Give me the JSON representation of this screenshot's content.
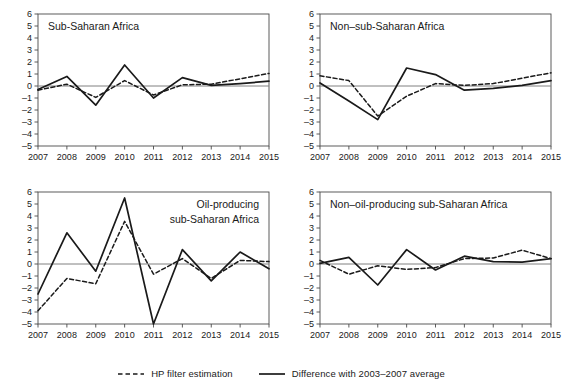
{
  "figure": {
    "name": "four-panel-line-chart",
    "y_axis": {
      "min": -5,
      "max": 6,
      "ticks": [
        "6",
        "5",
        "4",
        "3",
        "2",
        "1",
        "0",
        "–1",
        "–2",
        "–3",
        "–4",
        "–5"
      ]
    },
    "x_axis": {
      "ticks": [
        "2007",
        "2008",
        "2009",
        "2010",
        "2011",
        "2012",
        "2013",
        "2014",
        "2015"
      ]
    }
  },
  "legend": {
    "entries": [
      {
        "label": "HP filter estimation",
        "style": "dashed",
        "color": "#1a1a1a",
        "icon": "dashed-line-icon"
      },
      {
        "label": "Difference with 2003–2007 average",
        "style": "solid",
        "color": "#1a1a1a",
        "icon": "solid-line-icon"
      }
    ]
  },
  "chart_data": [
    {
      "type": "line",
      "panel": "top-left",
      "title": "Sub-Saharan Africa",
      "title_lines": [
        "Sub-Saharan Africa"
      ],
      "title_anchor": "left",
      "x": [
        2007,
        2008,
        2009,
        2010,
        2011,
        2012,
        2013,
        2014,
        2015
      ],
      "categories": [
        "2007",
        "2008",
        "2009",
        "2010",
        "2011",
        "2012",
        "2013",
        "2014",
        "2015"
      ],
      "xlabel": "",
      "ylabel": "",
      "ylim": [
        -5,
        6
      ],
      "xlim": [
        2007,
        2015
      ],
      "grid": false,
      "zero_line": true,
      "legend_position": "figure-bottom",
      "series": [
        {
          "name": "HP filter estimation",
          "style": "dashed",
          "values": [
            -0.35,
            0.15,
            -0.95,
            0.45,
            -0.75,
            0.1,
            0.15,
            0.6,
            1.05
          ]
        },
        {
          "name": "Difference with 2003–2007 average",
          "style": "solid",
          "values": [
            -0.3,
            0.8,
            -1.6,
            1.75,
            -1.0,
            0.7,
            0.05,
            0.2,
            0.4
          ]
        }
      ]
    },
    {
      "type": "line",
      "panel": "top-right",
      "title": "Non–sub-Saharan Africa",
      "title_lines": [
        "Non–sub-Saharan Africa"
      ],
      "title_anchor": "left",
      "x": [
        2007,
        2008,
        2009,
        2010,
        2011,
        2012,
        2013,
        2014,
        2015
      ],
      "categories": [
        "2007",
        "2008",
        "2009",
        "2010",
        "2011",
        "2012",
        "2013",
        "2014",
        "2015"
      ],
      "xlabel": "",
      "ylabel": "",
      "ylim": [
        -5,
        6
      ],
      "xlim": [
        2007,
        2015
      ],
      "grid": false,
      "zero_line": true,
      "legend_position": "figure-bottom",
      "series": [
        {
          "name": "HP filter estimation",
          "style": "dashed",
          "values": [
            0.85,
            0.45,
            -2.5,
            -0.85,
            0.2,
            0.05,
            0.2,
            0.65,
            1.1
          ]
        },
        {
          "name": "Difference with 2003–2007 average",
          "style": "solid",
          "values": [
            0.25,
            -1.25,
            -2.8,
            1.5,
            0.95,
            -0.35,
            -0.2,
            0.05,
            0.45
          ]
        }
      ]
    },
    {
      "type": "line",
      "panel": "bottom-left",
      "title": "Oil-producing sub-Saharan Africa",
      "title_lines": [
        "Oil-producing",
        "sub-Saharan Africa"
      ],
      "title_anchor": "right",
      "x": [
        2007,
        2008,
        2009,
        2010,
        2011,
        2012,
        2013,
        2014,
        2015
      ],
      "categories": [
        "2007",
        "2008",
        "2009",
        "2010",
        "2011",
        "2012",
        "2013",
        "2014",
        "2015"
      ],
      "xlabel": "",
      "ylabel": "",
      "ylim": [
        -5,
        6
      ],
      "xlim": [
        2007,
        2015
      ],
      "grid": false,
      "zero_line": true,
      "legend_position": "figure-bottom",
      "series": [
        {
          "name": "HP filter estimation",
          "style": "dashed",
          "values": [
            -3.9,
            -1.2,
            -1.65,
            3.55,
            -0.85,
            0.45,
            -1.2,
            0.3,
            0.2
          ]
        },
        {
          "name": "Difference with 2003–2007 average",
          "style": "solid",
          "values": [
            -2.5,
            2.6,
            -0.6,
            5.5,
            -5.0,
            1.2,
            -1.4,
            1.0,
            -0.4
          ]
        }
      ]
    },
    {
      "type": "line",
      "panel": "bottom-right",
      "title": "Non–oil-producing sub-Saharan Africa",
      "title_lines": [
        "Non–oil-producing sub-Saharan Africa"
      ],
      "title_anchor": "left",
      "x": [
        2007,
        2008,
        2009,
        2010,
        2011,
        2012,
        2013,
        2014,
        2015
      ],
      "categories": [
        "2007",
        "2008",
        "2009",
        "2010",
        "2011",
        "2012",
        "2013",
        "2014",
        "2015"
      ],
      "xlabel": "",
      "ylabel": "",
      "ylim": [
        -5,
        6
      ],
      "xlim": [
        2007,
        2015
      ],
      "grid": false,
      "zero_line": true,
      "legend_position": "figure-bottom",
      "series": [
        {
          "name": "HP filter estimation",
          "style": "dashed",
          "values": [
            0.3,
            -0.85,
            -0.15,
            -0.45,
            -0.3,
            0.45,
            0.5,
            1.15,
            0.45
          ]
        },
        {
          "name": "Difference with 2003–2007 average",
          "style": "solid",
          "values": [
            0.05,
            0.55,
            -1.75,
            1.2,
            -0.5,
            0.65,
            0.2,
            0.15,
            0.45
          ]
        }
      ]
    }
  ]
}
